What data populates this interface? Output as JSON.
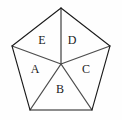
{
  "figure": {
    "name": "pentagon-divided-into-five-triangles",
    "background_color": "#fefefe",
    "outline_color": "#1a1a1a",
    "spoke_color": "#4d4d4d",
    "outline_width": 1.1,
    "spoke_width": 1.3,
    "label_color": "#1a1a1a",
    "label_font_size": 12
  },
  "geometry": {
    "center_point": {
      "name": "interior-point",
      "x": 61,
      "y": 64
    },
    "vertices": [
      {
        "name": "vertex-top",
        "x": 61,
        "y": 8
      },
      {
        "name": "vertex-right",
        "x": 110,
        "y": 46
      },
      {
        "name": "vertex-bottom-right",
        "x": 92,
        "y": 110
      },
      {
        "name": "vertex-bottom-left",
        "x": 30,
        "y": 110
      },
      {
        "name": "vertex-left",
        "x": 12,
        "y": 46
      }
    ],
    "outline_path": "M 61 8 L 110 46 L 92 110 L 30 110 L 12 46 Z",
    "spokes": [
      {
        "name": "spoke-to-top",
        "x1": 61,
        "y1": 64,
        "x2": 61,
        "y2": 8
      },
      {
        "name": "spoke-to-right",
        "x1": 61,
        "y1": 64,
        "x2": 110,
        "y2": 46
      },
      {
        "name": "spoke-to-bottom-right",
        "x1": 61,
        "y1": 64,
        "x2": 92,
        "y2": 110
      },
      {
        "name": "spoke-to-bottom-left",
        "x1": 61,
        "y1": 64,
        "x2": 30,
        "y2": 110
      },
      {
        "name": "spoke-to-left",
        "x1": 61,
        "y1": 64,
        "x2": 12,
        "y2": 46
      }
    ]
  },
  "regions": [
    {
      "id": "region-a",
      "label": "A",
      "label_x": 35,
      "label_y": 70,
      "position": "left"
    },
    {
      "id": "region-b",
      "label": "B",
      "label_x": 60,
      "label_y": 90,
      "position": "bottom"
    },
    {
      "id": "region-c",
      "label": "C",
      "label_x": 86,
      "label_y": 70,
      "position": "right"
    },
    {
      "id": "region-d",
      "label": "D",
      "label_x": 72,
      "label_y": 41,
      "position": "upper-right"
    },
    {
      "id": "region-e",
      "label": "E",
      "label_x": 42,
      "label_y": 41,
      "position": "upper-left"
    }
  ]
}
